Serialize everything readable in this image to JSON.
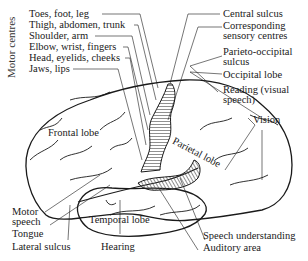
{
  "diagram": {
    "motor_centres_heading": "Motor centres",
    "left_labels": [
      "Toes, foot, leg",
      "Thigh, abdomen, trunk",
      "Shoulder, arm",
      "Elbow, wrist, fingers",
      "Head, eyelids, cheeks",
      "Jaws, lips"
    ],
    "right_labels": {
      "central_sulcus": "Central sulcus",
      "sensory_1": "Corresponding",
      "sensory_2": "sensory centres",
      "parieto_1": "Parieto-occipital",
      "parieto_2": "sulcus",
      "occipital": "Occipital lobe",
      "reading_1": "Reading (visual",
      "reading_2": "speech)",
      "vision": "Vision"
    },
    "lobes": {
      "frontal": "Frontal lobe",
      "parietal": "Parietal lobe",
      "temporal": "Temporal lobe"
    },
    "bottom_labels": {
      "motor_speech_1": "Motor",
      "motor_speech_2": "speech",
      "tongue": "Tongue",
      "lateral_sulcus": "Lateral sulcus",
      "hearing": "Hearing",
      "speech_understanding": "Speech understanding",
      "auditory_area": "Auditory area"
    },
    "colors": {
      "ink": "#1a1a1a",
      "background": "#ffffff"
    }
  }
}
